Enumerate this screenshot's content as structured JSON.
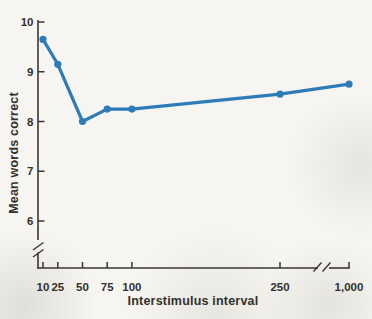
{
  "chart_data": {
    "type": "line",
    "title": "",
    "xlabel": "Interstimulus interval",
    "ylabel": "Mean words correct",
    "x": [
      10,
      25,
      50,
      75,
      100,
      250,
      1000
    ],
    "x_tick_labels": [
      "10",
      "25",
      "50",
      "75",
      "100",
      "250",
      "1,000"
    ],
    "values": [
      9.65,
      9.15,
      8.0,
      8.25,
      8.25,
      8.55,
      8.75
    ],
    "y_ticks": [
      6,
      7,
      8,
      9,
      10
    ],
    "y_axis_range_shown": [
      6,
      10
    ],
    "axis_breaks": {
      "y_axis_below": 6,
      "x_axis_between": [
        250,
        1000
      ]
    },
    "legend": "none",
    "grid": "off",
    "line_color": "#2d7cb8",
    "marker_color": "#2d7cb8",
    "axis_color": "#3a3733",
    "paper_color": "#f6f5f1"
  }
}
